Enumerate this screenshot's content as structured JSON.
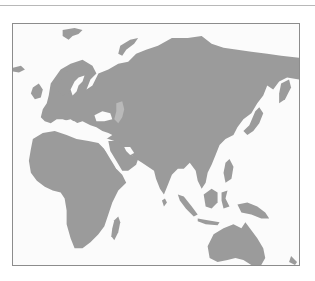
{
  "map": {
    "title": "",
    "style": "grayscale",
    "regions_shown": [
      "Europe",
      "Asia",
      "Africa",
      "Australia",
      "Arabian Peninsula",
      "Indian Subcontinent",
      "Southeast Asia",
      "Indonesia",
      "New Guinea",
      "Japan",
      "Madagascar",
      "Scandinavia",
      "Svalbard"
    ],
    "colors": {
      "land": "#9b9b9b",
      "water": "#fbfbfb",
      "frame_border": "#8c8c8c",
      "top_rule": "#b8b8b8",
      "inland_lake": "#b9b9b9"
    },
    "labels": []
  }
}
